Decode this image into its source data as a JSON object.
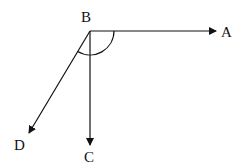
{
  "diagram": {
    "type": "angles",
    "vertex": {
      "label": "B",
      "x": 90,
      "y": 31
    },
    "rays": [
      {
        "label": "A",
        "to": [
          216,
          31
        ]
      },
      {
        "label": "C",
        "to": [
          90,
          145
        ]
      },
      {
        "label": "D",
        "to": [
          29,
          133
        ]
      }
    ],
    "arc": {
      "center": "B",
      "from_ray": "D",
      "to_ray": "A",
      "radius": 24
    },
    "colors": {
      "stroke": "#111111",
      "background": "#ffffff"
    }
  },
  "labels": {
    "A": "A",
    "B": "B",
    "C": "C",
    "D": "D"
  }
}
